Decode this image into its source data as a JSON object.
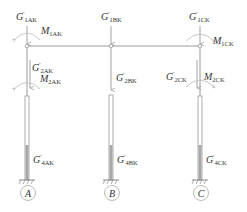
{
  "figure": {
    "type": "structural-frame-load-diagram",
    "colors": {
      "line": "#9a9a9a",
      "text": "#333333",
      "fill_dark": "#a8a8a8"
    }
  },
  "columns": [
    {
      "id": "A",
      "axis_label": "A",
      "loads": {
        "top": {
          "sym": "G",
          "prime": "'",
          "sub": "1AK"
        },
        "moment_top": {
          "sym": "M",
          "sub": "1AK"
        },
        "mid": {
          "sym": "G",
          "prime": "'",
          "sub": "2AK"
        },
        "moment_mid": {
          "sym": "M",
          "sub": "2AK"
        },
        "base": {
          "sym": "G",
          "prime": "'",
          "sub": "4AK"
        }
      }
    },
    {
      "id": "B",
      "axis_label": "B",
      "loads": {
        "top": {
          "sym": "G",
          "prime": "'",
          "sub": "1BK"
        },
        "mid": {
          "sym": "G",
          "prime": "'",
          "sub": "2BK"
        },
        "base": {
          "sym": "G",
          "prime": "'",
          "sub": "4BK"
        }
      }
    },
    {
      "id": "C",
      "axis_label": "C",
      "loads": {
        "top": {
          "sym": "G",
          "prime": "'",
          "sub": "1CK"
        },
        "moment_top": {
          "sym": "M",
          "sub": "1CK"
        },
        "mid": {
          "sym": "G",
          "prime": "'",
          "sub": "2CK"
        },
        "moment_mid": {
          "sym": "M",
          "sub": "2CK"
        },
        "base": {
          "sym": "G",
          "prime": "'",
          "sub": "4CK"
        }
      }
    }
  ]
}
